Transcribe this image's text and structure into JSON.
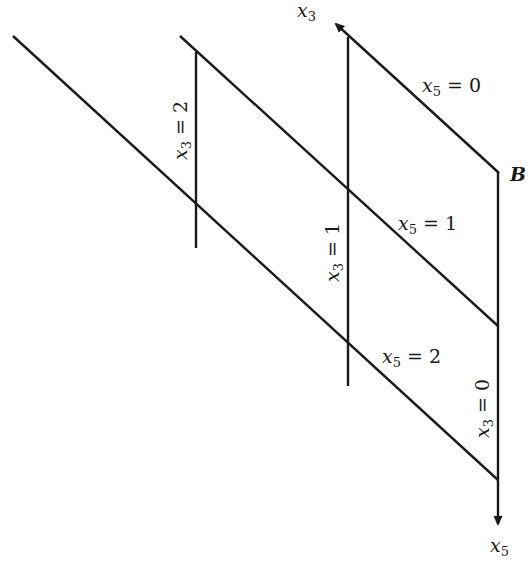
{
  "diagram": {
    "axes": {
      "top": {
        "var": "x",
        "sub": "3"
      },
      "bottom": {
        "var": "x",
        "sub": "5"
      }
    },
    "point_label": "B",
    "horizontal_labels": [
      {
        "var": "x",
        "sub": "5",
        "eq": "= 0"
      },
      {
        "var": "x",
        "sub": "5",
        "eq": "= 1"
      },
      {
        "var": "x",
        "sub": "5",
        "eq": "= 2"
      }
    ],
    "vertical_labels": [
      {
        "var": "x",
        "sub": "3",
        "eq": "= 2"
      },
      {
        "var": "x",
        "sub": "3",
        "eq": "= 1"
      },
      {
        "var": "x",
        "sub": "3",
        "eq": "= 0"
      }
    ],
    "colors": {
      "ink": "#1a1a1a",
      "background": "#ffffff"
    }
  }
}
